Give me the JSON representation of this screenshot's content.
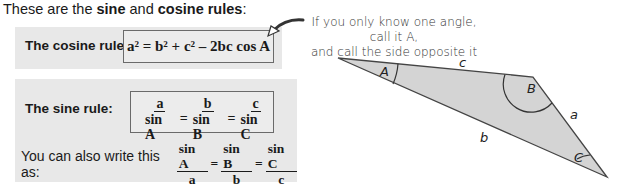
{
  "intro": {
    "prefix": "These are the ",
    "sine": "sine",
    "and": " and ",
    "cosine_rules": "cosine rules",
    "suffix": ":"
  },
  "cosine_rule": {
    "label": "The cosine rule:",
    "formula": "a² = b² + c² – 2bc cos A"
  },
  "sine_rule": {
    "label": "The sine rule:",
    "fractions": [
      {
        "num": "a",
        "den": "sin A"
      },
      {
        "num": "b",
        "den": "sin B"
      },
      {
        "num": "c",
        "den": "sin C"
      }
    ],
    "eq": "="
  },
  "alternative": {
    "text": "You can also write this as:",
    "fractions": [
      {
        "num": "sin A",
        "den": "a"
      },
      {
        "num": "sin B",
        "den": "b"
      },
      {
        "num": "sin C",
        "den": "c"
      }
    ],
    "eq": "="
  },
  "note": {
    "line1": "If you only know one angle, call it A,",
    "line2": "and call the side opposite it a."
  },
  "triangle": {
    "angles": {
      "A": "A",
      "B": "B",
      "C": "C"
    },
    "sides": {
      "a": "a",
      "b": "b",
      "c": "c"
    },
    "fill": "#d4d4d4",
    "stroke": "#444444"
  }
}
